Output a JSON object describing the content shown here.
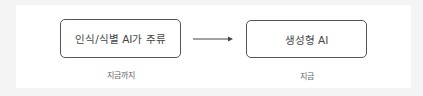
{
  "diagram": {
    "nodes": [
      {
        "label": "인식/식별 AI가 주류",
        "caption": "지금까지"
      },
      {
        "label": "생성형 AI",
        "caption": "지금"
      }
    ],
    "edges": [
      {
        "from": 0,
        "to": 1,
        "type": "arrow"
      }
    ],
    "colors": {
      "border": "#555555",
      "text": "#444444",
      "caption": "#666666",
      "background": "#ffffff",
      "outer": "#f4f4f4"
    }
  }
}
